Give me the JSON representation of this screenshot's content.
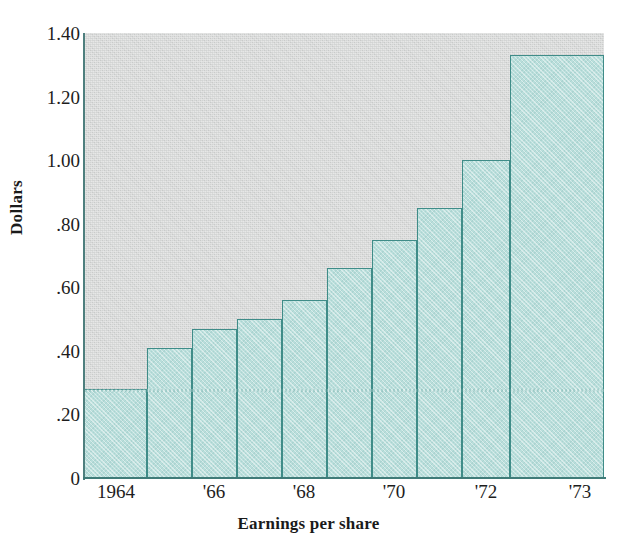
{
  "chart_data": {
    "type": "bar",
    "title": "",
    "xlabel": "Earnings per share",
    "ylabel": "Dollars",
    "categories": [
      "1964",
      "1965",
      "1966",
      "1967",
      "1968",
      "1969",
      "1970",
      "1971",
      "1972",
      "1973"
    ],
    "values": [
      0.28,
      0.41,
      0.47,
      0.5,
      0.56,
      0.66,
      0.75,
      0.85,
      1.0,
      1.33
    ],
    "ylim": [
      0,
      1.4
    ],
    "ytick_labels": [
      "1.40",
      "1.20",
      "1.00",
      ".80",
      ".60",
      ".40",
      ".20",
      "0"
    ],
    "ytick_values": [
      1.4,
      1.2,
      1.0,
      0.8,
      0.6,
      0.4,
      0.2,
      0
    ],
    "xtick_labels": [
      "1964",
      "'66",
      "'68",
      "'70",
      "'72",
      "'73"
    ],
    "xtick_categories": [
      "1964",
      "1966",
      "1968",
      "1970",
      "1972",
      "1973"
    ],
    "grid": false,
    "legend": null,
    "colors": {
      "bar_fill": "#b9dedb",
      "bar_edge": "#3f8c88",
      "plot_background": "#d2d4d3",
      "axis": "#3f7b78",
      "text": "#1d1d1d"
    }
  },
  "axes": {
    "y_title": "Dollars",
    "x_title": "Earnings per share",
    "y_ticks": [
      {
        "label": "1.40",
        "value": 1.4
      },
      {
        "label": "1.20",
        "value": 1.2
      },
      {
        "label": "1.00",
        "value": 1.0
      },
      {
        "label": ".80",
        "value": 0.8
      },
      {
        "label": ".60",
        "value": 0.6
      },
      {
        "label": ".40",
        "value": 0.4
      },
      {
        "label": ".20",
        "value": 0.2
      },
      {
        "label": "0",
        "value": 0
      }
    ],
    "x_ticks": [
      {
        "label": "1964",
        "index": 0
      },
      {
        "label": "'66",
        "index": 2
      },
      {
        "label": "'68",
        "index": 4
      },
      {
        "label": "'70",
        "index": 6
      },
      {
        "label": "'72",
        "index": 8
      },
      {
        "label": "'73",
        "index": 9
      }
    ]
  },
  "bars": [
    {
      "category": "1964",
      "value": 0.28,
      "label": "0.28",
      "x": 0,
      "width": 62,
      "wide": false
    },
    {
      "category": "1965",
      "value": 0.41,
      "label": "0.41",
      "x": 62,
      "width": 45,
      "wide": false
    },
    {
      "category": "1966",
      "value": 0.47,
      "label": "0.47",
      "x": 107,
      "width": 45,
      "wide": false
    },
    {
      "category": "1967",
      "value": 0.5,
      "label": "0.50",
      "x": 152,
      "width": 45,
      "wide": false
    },
    {
      "category": "1968",
      "value": 0.56,
      "label": "0.56",
      "x": 197,
      "width": 45,
      "wide": false
    },
    {
      "category": "1969",
      "value": 0.66,
      "label": "0.66",
      "x": 242,
      "width": 45,
      "wide": false
    },
    {
      "category": "1970",
      "value": 0.75,
      "label": "0.75",
      "x": 287,
      "width": 45,
      "wide": false
    },
    {
      "category": "1971",
      "value": 0.85,
      "label": "0.85",
      "x": 332,
      "width": 45,
      "wide": false
    },
    {
      "category": "1972",
      "value": 1.0,
      "label": "1.00",
      "x": 377,
      "width": 48,
      "wide": false
    },
    {
      "category": "1973",
      "value": 1.33,
      "label": "1.33",
      "x": 425,
      "width": 94,
      "wide": true
    }
  ],
  "geometry": {
    "plot_left": 85,
    "plot_top": 33,
    "plot_width": 519,
    "plot_height": 445,
    "y_max": 1.4,
    "x_tick_positions": [
      116,
      214,
      304,
      394,
      486,
      580
    ]
  }
}
